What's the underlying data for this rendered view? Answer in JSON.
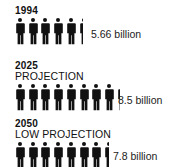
{
  "rows": [
    {
      "year": "1994",
      "subtitle": "",
      "value_label": "5.66 billion",
      "value": 5.66
    },
    {
      "year": "2025",
      "subtitle": "PROJECTION",
      "value_label": "8.5 billion",
      "value": 8.5
    },
    {
      "year": "2050",
      "subtitle": "LOW PROJECTION",
      "value_label": "7.8 billion",
      "value": 7.8
    }
  ],
  "icon": "person-icon",
  "unit": "1 figure = 1 billion people",
  "colors": {
    "figure": "#111111",
    "text": "#111111"
  }
}
